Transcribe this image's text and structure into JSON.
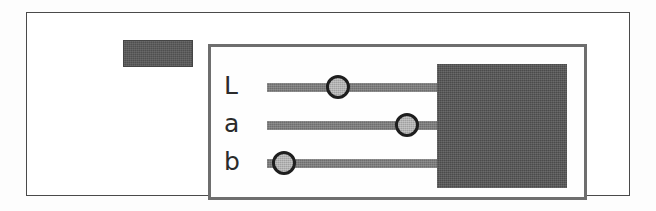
{
  "figure": {
    "kind": "lab-color-picker-widget",
    "background_color": "#fdfdfd",
    "outer_frame_color": "#4a4a4a"
  },
  "top_button": {
    "label": "",
    "fill_color": "#4f4f4f"
  },
  "panel": {
    "border_color": "#6e6e6e",
    "background_color": "#fefefe"
  },
  "sliders": [
    {
      "label": "L",
      "name": "lightness",
      "value_percent": 33,
      "track_color": "#6d6d6d",
      "thumb_color": "#a0a0a0",
      "thumb_outline_color": "#1e1e1e"
    },
    {
      "label": "a",
      "name": "green-red",
      "value_percent": 65,
      "track_color": "#6d6d6d",
      "thumb_color": "#a0a0a0",
      "thumb_outline_color": "#1e1e1e"
    },
    {
      "label": "b",
      "name": "blue-yellow",
      "value_percent": 8,
      "track_color": "#6d6d6d",
      "thumb_color": "#a0a0a0",
      "thumb_outline_color": "#1e1e1e"
    }
  ],
  "preview": {
    "label": "",
    "fill_color": "#4b4b4b"
  }
}
